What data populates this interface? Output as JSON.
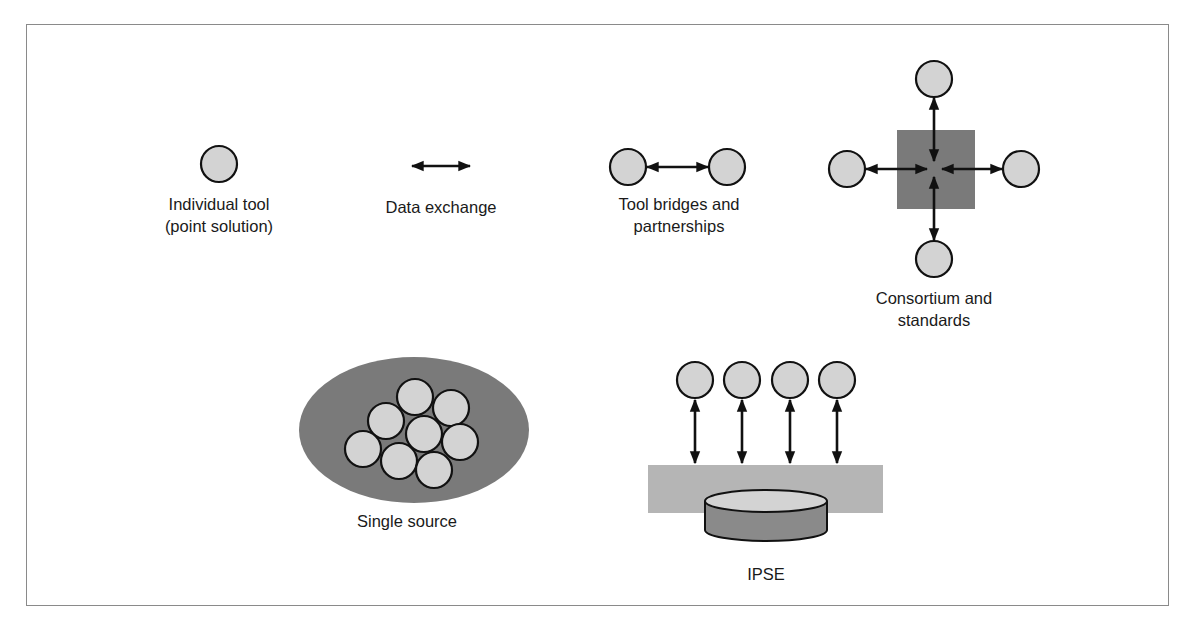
{
  "colors": {
    "tool_fill": "#d3d3d3",
    "dark_fill": "#7a7a7a",
    "light_band": "#b5b5b5",
    "stroke": "#111111"
  },
  "items": {
    "individual_tool": {
      "label_line1": "Individual tool",
      "label_line2": "(point solution)"
    },
    "data_exchange": {
      "label": "Data exchange"
    },
    "tool_bridges": {
      "label_line1": "Tool bridges and",
      "label_line2": "partnerships"
    },
    "consortium": {
      "label_line1": "Consortium and",
      "label_line2": "standards",
      "tool_count": 4
    },
    "single_source": {
      "label": "Single source",
      "tool_count": 8
    },
    "ipse": {
      "label": "IPSE",
      "tool_count": 4
    }
  }
}
